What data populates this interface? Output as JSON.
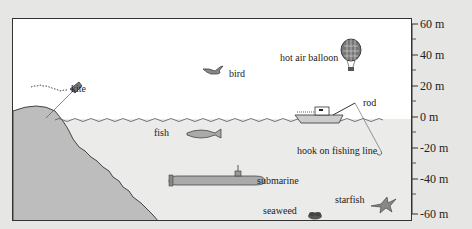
{
  "diagram": {
    "type": "altitude-number-line",
    "unit": "m",
    "axis": {
      "ticks": [
        {
          "value": 60,
          "label": "60 m"
        },
        {
          "value": 40,
          "label": "40 m"
        },
        {
          "value": 20,
          "label": "20 m"
        },
        {
          "value": 0,
          "label": "0 m"
        },
        {
          "value": -20,
          "label": "-20 m"
        },
        {
          "value": -40,
          "label": "-40 m"
        },
        {
          "value": -60,
          "label": "-60 m"
        }
      ],
      "minor_ticks_every": 10
    },
    "labels": {
      "kite": "kite",
      "bird": "bird",
      "hot_air_balloon": "hot air balloon",
      "rod": "rod",
      "fish": "fish",
      "hook": "hook on fishing line",
      "submarine": "submarine",
      "starfish": "starfish",
      "seaweed": "seaweed"
    },
    "colors": {
      "background": "#e6e6e4",
      "sky": "#ffffff",
      "water": "#ebebea",
      "cliff": "#bdbdbd",
      "outline": "#333333"
    }
  }
}
